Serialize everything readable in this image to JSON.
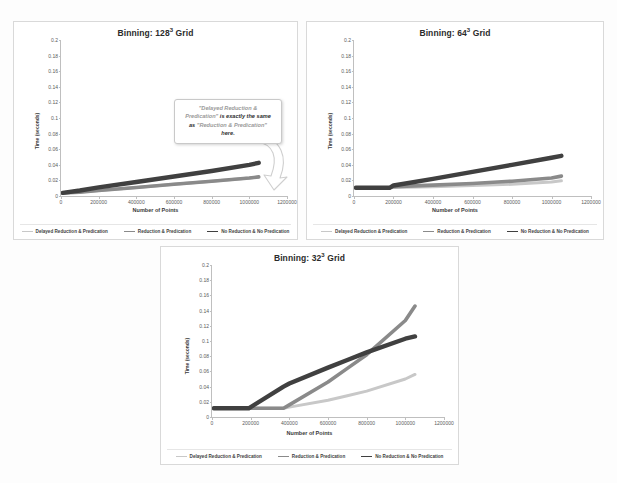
{
  "page": {
    "background": "#fdfdfd"
  },
  "series_colors": {
    "delayed": "#c8c8c8",
    "reduction": "#8a8a8a",
    "none": "#404040"
  },
  "legend": {
    "items": [
      {
        "label": "Delayed Reduction & Predication",
        "color": "#c8c8c8",
        "width": "1.2px"
      },
      {
        "label": "Reduction & Predication",
        "color": "#8a8a8a",
        "width": "1.4px"
      },
      {
        "label": "No Reduction & No Predication",
        "color": "#404040",
        "width": "1.6px"
      }
    ]
  },
  "axes": {
    "xlabel": "Number of Points",
    "ylabel": "Time (seconds)",
    "xticks": [
      "0",
      "200000",
      "400000",
      "600000",
      "800000",
      "1000000",
      "1200000"
    ],
    "yticks": [
      "0",
      "0.02",
      "0.04",
      "0.06",
      "0.08",
      "0.1",
      "0.12",
      "0.14",
      "0.16",
      "0.18",
      "0.2"
    ]
  },
  "callout": {
    "quote_open": "\"Delayed Reduction & Predication\"",
    "middle": " is exactly the same as ",
    "quote_close": "\"Reduction & Predication\"",
    "tail": " here.",
    "line1_faded": "\"Delayed Reduction &",
    "line2_faded": "Predication\"",
    "line2_rest": " is exactly the same",
    "line3_lead": "as ",
    "line3_quote": "\"Reduction & Predication\"",
    "line4": "here."
  },
  "charts": [
    {
      "id": "chart-128",
      "title_prefix": "Binning: 128",
      "title_sup": "3",
      "title_suffix": " Grid",
      "title_full": "Binning: 128³ Grid"
    },
    {
      "id": "chart-64",
      "title_prefix": "Binning: 64",
      "title_sup": "3",
      "title_suffix": " Grid",
      "title_full": "Binning: 64³ Grid"
    },
    {
      "id": "chart-32",
      "title_prefix": "Binning: 32",
      "title_sup": "3",
      "title_suffix": " Grid",
      "title_full": "Binning: 32³ Grid"
    }
  ],
  "chart_data": [
    {
      "type": "line",
      "title": "Binning: 128³ Grid",
      "xlabel": "Number of Points",
      "ylabel": "Time (seconds)",
      "xlim": [
        0,
        1200000
      ],
      "ylim": [
        0,
        0.2
      ],
      "grid": false,
      "legend_position": "bottom",
      "x": [
        10000,
        100000,
        200000,
        400000,
        600000,
        800000,
        1000000,
        1050000
      ],
      "series": [
        {
          "name": "Delayed Reduction & Predication",
          "color": "#c8c8c8",
          "values": [
            0.004,
            0.005,
            0.007,
            0.011,
            0.015,
            0.019,
            0.023,
            0.0245
          ]
        },
        {
          "name": "Reduction & Predication",
          "color": "#8a8a8a",
          "values": [
            0.004,
            0.005,
            0.007,
            0.011,
            0.015,
            0.019,
            0.023,
            0.0245
          ]
        },
        {
          "name": "No Reduction & No Predication",
          "color": "#404040",
          "values": [
            0.004,
            0.007,
            0.011,
            0.018,
            0.025,
            0.032,
            0.04,
            0.0425
          ]
        }
      ]
    },
    {
      "type": "line",
      "title": "Binning: 64³ Grid",
      "xlabel": "Number of Points",
      "ylabel": "Time (seconds)",
      "xlim": [
        0,
        1200000
      ],
      "ylim": [
        0,
        0.2
      ],
      "grid": false,
      "legend_position": "bottom",
      "x": [
        10000,
        100000,
        180000,
        200000,
        400000,
        600000,
        800000,
        1000000,
        1050000
      ],
      "series": [
        {
          "name": "Delayed Reduction & Predication",
          "color": "#c8c8c8",
          "values": [
            0.0105,
            0.0105,
            0.0105,
            0.011,
            0.012,
            0.0135,
            0.015,
            0.018,
            0.0195
          ]
        },
        {
          "name": "Reduction & Predication",
          "color": "#8a8a8a",
          "values": [
            0.0105,
            0.0105,
            0.0105,
            0.012,
            0.014,
            0.016,
            0.019,
            0.023,
            0.0255
          ]
        },
        {
          "name": "No Reduction & No Predication",
          "color": "#404040",
          "values": [
            0.0105,
            0.0105,
            0.0105,
            0.0135,
            0.022,
            0.031,
            0.04,
            0.049,
            0.0515
          ]
        }
      ]
    },
    {
      "type": "line",
      "title": "Binning: 32³ Grid",
      "xlabel": "Number of Points",
      "ylabel": "Time (seconds)",
      "xlim": [
        0,
        1200000
      ],
      "ylim": [
        0,
        0.2
      ],
      "grid": false,
      "legend_position": "bottom",
      "x": [
        10000,
        100000,
        190000,
        370000,
        400000,
        600000,
        700000,
        800000,
        1000000,
        1050000
      ],
      "series": [
        {
          "name": "Delayed Reduction & Predication",
          "color": "#c8c8c8",
          "values": [
            0.0115,
            0.0115,
            0.0115,
            0.0115,
            0.013,
            0.022,
            0.028,
            0.034,
            0.05,
            0.056
          ]
        },
        {
          "name": "Reduction & Predication",
          "color": "#8a8a8a",
          "values": [
            0.0115,
            0.0115,
            0.0115,
            0.0115,
            0.016,
            0.046,
            0.064,
            0.082,
            0.127,
            0.146
          ]
        },
        {
          "name": "No Reduction & No Predication",
          "color": "#404040",
          "values": [
            0.0115,
            0.0115,
            0.0115,
            0.04,
            0.044,
            0.065,
            0.075,
            0.085,
            0.103,
            0.106
          ]
        }
      ]
    }
  ]
}
